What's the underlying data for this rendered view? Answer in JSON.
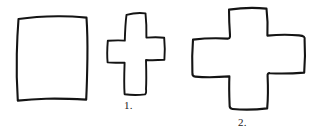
{
  "figure": {
    "background_color": "#ffffff",
    "stroke_color": "#141414",
    "style": "hand-drawn black outline line art",
    "shapes": [
      {
        "id": "square",
        "name": "hand-drawn-square",
        "label": "",
        "description": "Irregular hand-drawn square / rectangle outline with slightly wavy edges",
        "bbox": [
          17,
          16,
          71,
          84
        ]
      },
      {
        "id": "cross-1",
        "name": "hand-drawn-cross-tall",
        "label": "1.",
        "description": "Tall narrow hand-drawn cross (plus sign) outline, vertical bar longer than horizontal arms",
        "bbox": [
          107,
          12,
          58,
          83
        ]
      },
      {
        "id": "cross-2",
        "name": "hand-drawn-cross-wide",
        "label": "2.",
        "description": "Larger wide hand-drawn cross (plus sign) outline with broad arms",
        "bbox": [
          192,
          7,
          113,
          103
        ]
      }
    ]
  },
  "labels": {
    "cross_1": "1.",
    "cross_2": "2."
  }
}
